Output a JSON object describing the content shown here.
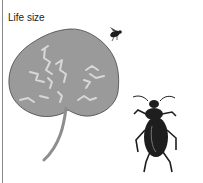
{
  "figure": {
    "label": "Life size",
    "subjects": [
      "leaf-with-mines",
      "small-fly",
      "beetle"
    ],
    "colors": {
      "leaf": "#9a9a9a",
      "mine_trails": "#d8d8d8",
      "insect": "#1e1e1e",
      "border": "#888888"
    }
  }
}
